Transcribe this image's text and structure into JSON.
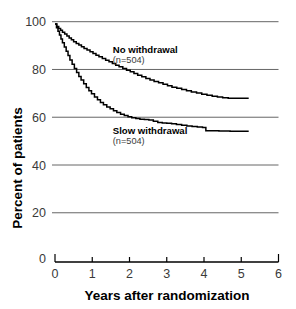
{
  "chart_data": {
    "type": "line",
    "title": "",
    "xlabel": "Years after randomization",
    "ylabel": "Percent of patients",
    "xlim": [
      0,
      6
    ],
    "ylim": [
      0,
      100
    ],
    "grid": true,
    "legend_position": "inline-annotation",
    "xticks": [
      0,
      1,
      2,
      3,
      4,
      5,
      6
    ],
    "xtick_labels": [
      "0",
      "1",
      "2",
      "3",
      "4",
      "5",
      "6"
    ],
    "yticks": [
      0,
      20,
      40,
      60,
      80,
      100
    ],
    "ytick_labels": [
      "0",
      "20",
      "40",
      "60",
      "80",
      "100"
    ],
    "y_zero_label": "0",
    "series": [
      {
        "name": "No withdrawal",
        "annotation_label": "No withdrawal",
        "annotation_sublabel": "(n=504)",
        "color": "#000000",
        "step": true,
        "x": [
          0.0,
          0.05,
          0.1,
          0.15,
          0.2,
          0.26,
          0.32,
          0.38,
          0.44,
          0.5,
          0.57,
          0.64,
          0.71,
          0.78,
          0.86,
          0.94,
          1.02,
          1.1,
          1.18,
          1.27,
          1.36,
          1.45,
          1.54,
          1.63,
          1.72,
          1.82,
          1.92,
          2.02,
          2.12,
          2.22,
          2.33,
          2.44,
          2.55,
          2.66,
          2.78,
          2.9,
          3.02,
          3.14,
          3.27,
          3.4,
          3.53,
          3.66,
          3.8,
          3.94,
          4.08,
          4.22,
          4.36,
          4.5,
          4.65,
          4.8,
          5.0,
          5.2
        ],
        "y": [
          99.0,
          98.0,
          97.2,
          96.4,
          95.6,
          94.8,
          94.0,
          93.2,
          92.4,
          91.6,
          90.9,
          90.2,
          89.5,
          88.8,
          88.1,
          87.4,
          86.7,
          86.0,
          85.3,
          84.6,
          83.9,
          83.2,
          82.5,
          81.8,
          81.1,
          80.4,
          79.7,
          79.0,
          78.3,
          77.6,
          76.9,
          76.2,
          75.6,
          75.0,
          74.4,
          73.8,
          73.2,
          72.6,
          72.1,
          71.6,
          71.1,
          70.6,
          70.1,
          69.6,
          69.2,
          68.8,
          68.5,
          68.2,
          68.0,
          67.9,
          67.9,
          67.9
        ]
      },
      {
        "name": "Slow withdrawal",
        "annotation_label": "Slow withdrawal",
        "annotation_sublabel": "(n=504)",
        "color": "#000000",
        "step": true,
        "x": [
          0.0,
          0.04,
          0.08,
          0.12,
          0.16,
          0.2,
          0.25,
          0.3,
          0.35,
          0.4,
          0.46,
          0.52,
          0.58,
          0.64,
          0.7,
          0.77,
          0.84,
          0.91,
          0.98,
          1.06,
          1.14,
          1.22,
          1.3,
          1.39,
          1.48,
          1.57,
          1.66,
          1.76,
          1.86,
          1.96,
          2.06,
          2.17,
          2.28,
          2.4,
          2.52,
          2.64,
          2.76,
          2.88,
          3.0,
          3.13,
          3.26,
          3.4,
          3.54,
          3.68,
          3.82,
          3.96,
          4.05,
          4.2,
          4.4,
          4.7,
          5.0,
          5.2
        ],
        "y": [
          99.0,
          97.5,
          96.0,
          94.4,
          92.8,
          91.2,
          89.4,
          87.6,
          85.8,
          84.0,
          82.2,
          80.4,
          78.7,
          77.1,
          75.6,
          74.0,
          72.5,
          71.1,
          69.8,
          68.5,
          67.3,
          66.2,
          65.2,
          64.3,
          63.5,
          62.7,
          62.0,
          61.3,
          60.7,
          60.2,
          59.8,
          59.5,
          59.2,
          59.0,
          58.8,
          58.3,
          57.8,
          57.6,
          57.5,
          57.3,
          57.0,
          56.6,
          56.3,
          56.1,
          55.9,
          55.7,
          54.3,
          54.3,
          54.2,
          54.1,
          54.1,
          54.1
        ]
      }
    ],
    "annotations": [
      {
        "text": "No withdrawal",
        "sub": "(n=504)",
        "x": 1.55,
        "y": 87
      },
      {
        "text": "Slow withdrawal",
        "sub": "(n=504)",
        "x": 1.55,
        "y": 53
      }
    ]
  }
}
